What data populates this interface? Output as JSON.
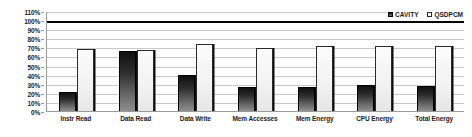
{
  "chart_data": {
    "type": "bar",
    "title": "",
    "xlabel": "",
    "ylabel": "",
    "ylim": [
      0,
      110
    ],
    "grid": true,
    "legend_position": "top-right",
    "y_ticks": [
      "0%",
      "10%",
      "20%",
      "30%",
      "40%",
      "50%",
      "60%",
      "70%",
      "80%",
      "90%",
      "100%",
      "110%"
    ],
    "reference_line": 100,
    "categories": [
      "Instr Read",
      "Data Read",
      "Data Write",
      "Mem Accesses",
      "Mem Energy",
      "CPU Energy",
      "Total Energy"
    ],
    "series": [
      {
        "name": "CAVITY",
        "color": "#1a1a1a",
        "values": [
          21,
          66,
          40,
          26,
          26,
          29,
          28
        ]
      },
      {
        "name": "QSDPCM",
        "color": "#fbfbfb",
        "values": [
          68,
          67,
          74,
          69,
          72,
          72,
          72
        ]
      }
    ]
  },
  "legend": {
    "items": [
      {
        "label": "CAVITY",
        "icon": "filled-square-swatch"
      },
      {
        "label": "QSDPCM",
        "icon": "hollow-square-swatch"
      }
    ]
  }
}
